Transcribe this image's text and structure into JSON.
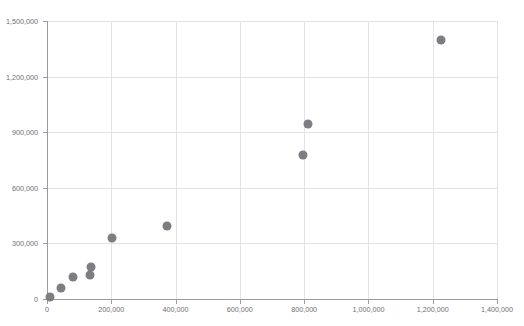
{
  "top_caption": "",
  "chart_data": {
    "type": "scatter",
    "title": "",
    "subtitle": "",
    "xlabel": "",
    "ylabel": "",
    "xlim": [
      0,
      1400000
    ],
    "ylim": [
      0,
      1500000
    ],
    "grid": true,
    "legend": "none",
    "marker": {
      "color": "#7d7d82",
      "shape": "circle",
      "size_px": 9
    },
    "x_ticks": [
      0,
      200000,
      400000,
      600000,
      800000,
      1000000,
      1200000,
      1400000
    ],
    "x_tick_labels": [
      "0",
      "200,000",
      "400,000",
      "600,000",
      "800,000",
      "1,000,000",
      "1,200,000",
      "1,400,000"
    ],
    "y_ticks": [
      0,
      300000,
      600000,
      900000,
      1200000,
      1500000
    ],
    "y_tick_labels": [
      "0",
      "300,000",
      "600,000",
      "900,000",
      "1,200,000",
      "1,500,000"
    ],
    "points": [
      {
        "x": 8000,
        "y": 12000
      },
      {
        "x": 42000,
        "y": 62000
      },
      {
        "x": 80000,
        "y": 120000
      },
      {
        "x": 133000,
        "y": 130000
      },
      {
        "x": 138000,
        "y": 172000
      },
      {
        "x": 202000,
        "y": 330000
      },
      {
        "x": 372000,
        "y": 396000
      },
      {
        "x": 797000,
        "y": 778000
      },
      {
        "x": 812000,
        "y": 945000
      },
      {
        "x": 1225000,
        "y": 1396000
      }
    ]
  }
}
